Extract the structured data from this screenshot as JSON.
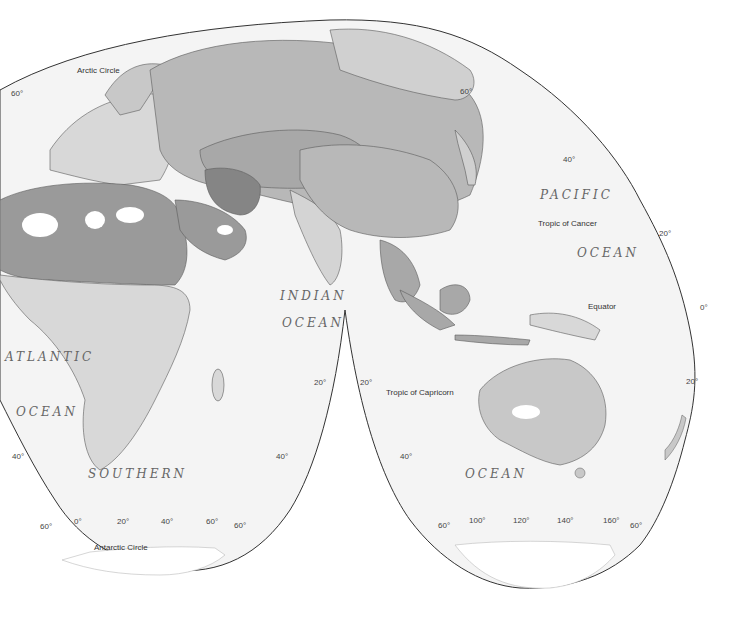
{
  "map": {
    "projection": "interrupted",
    "colors": {
      "background": "#ffffff",
      "ocean": "#f4f4f4",
      "land_light": "#d8d8d8",
      "land_medium": "#b8b8b8",
      "land_dark": "#9a9a9a",
      "land_darkest": "#858585",
      "border": "#5a5a5a",
      "outline": "#333333"
    },
    "ocean_labels": [
      {
        "id": "pacific-1",
        "text": "PACIFIC"
      },
      {
        "id": "pacific-2",
        "text": "OCEAN"
      },
      {
        "id": "indian-1",
        "text": "INDIAN"
      },
      {
        "id": "indian-2",
        "text": "OCEAN"
      },
      {
        "id": "atlantic-1",
        "text": "ATLANTIC"
      },
      {
        "id": "atlantic-2",
        "text": "OCEAN"
      },
      {
        "id": "southern-1",
        "text": "SOUTHERN"
      },
      {
        "id": "southern-2",
        "text": "OCEAN"
      }
    ],
    "line_labels": {
      "arctic_circle": "Arctic Circle",
      "tropic_of_cancer": "Tropic of Cancer",
      "equator": "Equator",
      "tropic_of_capricorn": "Tropic of Capricorn",
      "antarctic_circle": "Antarctic Circle"
    },
    "latitude_labels": {
      "nw_60": "60°",
      "ne_60": "60°",
      "e_40": "40°",
      "e_20n": "20°",
      "e_0": "0°",
      "e_20s": "20°",
      "indian_w_20": "20°",
      "indian_e_20": "20°",
      "sw_40": "40°",
      "sm_40": "40°",
      "se_40": "40°",
      "s_60_a": "60°",
      "s_60_b": "60°",
      "s_60_c": "60°",
      "s_60_d": "60°"
    },
    "longitude_labels": [
      "0°",
      "20°",
      "40°",
      "60°",
      "100°",
      "120°",
      "140°",
      "160°"
    ]
  }
}
